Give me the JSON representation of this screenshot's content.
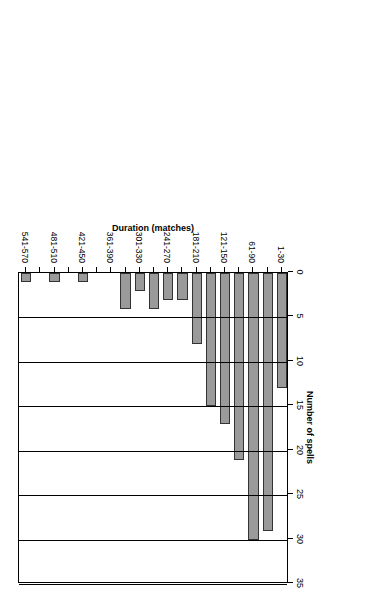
{
  "chart_data": {
    "type": "bar",
    "orientation": "horizontal-rotated",
    "title": "",
    "xlabel": "Duration (matches)",
    "ylabel": "Number of spells",
    "categories": [
      "1-30",
      "31-60",
      "61-90",
      "91-120",
      "121-150",
      "151-180",
      "181-210",
      "211-240",
      "241-270",
      "271-300",
      "301-330",
      "331-360",
      "361-390",
      "391-420",
      "421-450",
      "451-480",
      "481-510",
      "511-540",
      "541-570"
    ],
    "values": [
      13,
      29,
      30,
      21,
      17,
      15,
      8,
      3,
      3,
      4,
      2,
      4,
      0,
      0,
      1,
      0,
      1,
      0,
      1
    ],
    "visible_tick_labels": [
      "1-30",
      "61-90",
      "121-150",
      "181-210",
      "241-270",
      "301-330",
      "361-390",
      "421-450",
      "481-510",
      "541-570"
    ],
    "value_axis": {
      "ticks": [
        0,
        5,
        10,
        15,
        20,
        25,
        30,
        35
      ],
      "tick_labels": [
        "0",
        "5",
        "10",
        "15",
        "20",
        "25",
        "30",
        "35"
      ],
      "min": 0,
      "max": 35
    },
    "grid": "vertical",
    "legend": "none",
    "bar_color": "#9a9a9a",
    "bar_edge_color": "#333333"
  },
  "axes": {
    "value_axis_title": "Number of spells",
    "category_axis_title": "Duration (matches)"
  }
}
